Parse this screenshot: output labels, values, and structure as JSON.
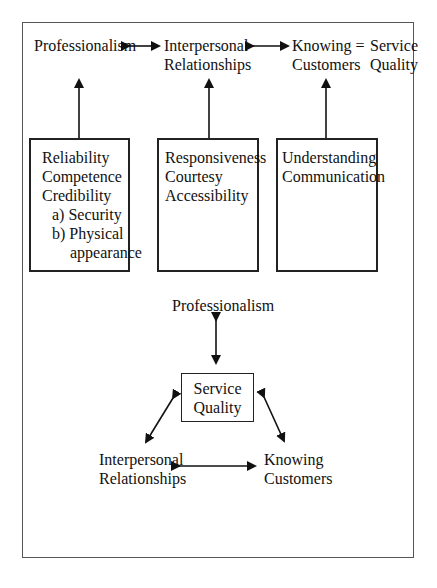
{
  "top_row": {
    "professionalism": "Professionalism",
    "interpersonal_line1": "Interpersonal",
    "interpersonal_line2": "Relationships",
    "knowing_line1": "Knowing =",
    "knowing_line2": "Customers",
    "service_line1": "Service",
    "service_line2": "Quality"
  },
  "boxes": [
    {
      "lines": [
        "Reliability",
        "Competence",
        "Credibility",
        "a)  Security",
        "b)  Physical",
        "appearance"
      ]
    },
    {
      "lines": [
        "Responsiveness",
        "Courtesy",
        "Accessibility"
      ]
    },
    {
      "lines": [
        "Understanding",
        "Communication"
      ]
    }
  ],
  "triangle": {
    "top": "Professionalism",
    "center_line1": "Service",
    "center_line2": "Quality",
    "left_line1": "Interpersonal",
    "left_line2": "Relationships",
    "right_line1": "Knowing",
    "right_line2": "Customers"
  },
  "colors": {
    "line": "#111111",
    "frame": "#555555",
    "background": "#ffffff"
  }
}
